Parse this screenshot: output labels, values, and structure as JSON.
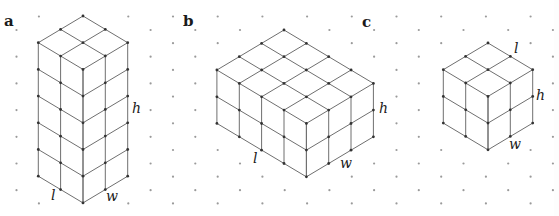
{
  "figure": {
    "grid": {
      "origin_x": 16.5,
      "col_spacing": 22.35,
      "cols": 25,
      "even_col_y0": 30,
      "odd_col_y0": 16.5,
      "row_spacing": 26.7,
      "rows": 8
    },
    "panels": [
      {
        "id": "a",
        "label": "a",
        "label_pos": [
          4,
          14
        ],
        "top_vertex": [
          83,
          16
        ],
        "left_units": 2,
        "right_units": 2,
        "height_units": 5,
        "dimension_labels": [
          {
            "text": "l",
            "pos": [
              51,
              188
            ]
          },
          {
            "text": "w",
            "pos": [
              106,
              189
            ]
          },
          {
            "text": "h",
            "pos": [
              132,
              101
            ]
          }
        ]
      },
      {
        "id": "b",
        "label": "b",
        "label_pos": [
          183,
          14
        ],
        "top_vertex": [
          284,
          30
        ],
        "left_units": 3,
        "right_units": 4,
        "height_units": 2,
        "dimension_labels": [
          {
            "text": "l",
            "pos": [
              253,
              151
            ]
          },
          {
            "text": "w",
            "pos": [
              340,
              156
            ]
          },
          {
            "text": "h",
            "pos": [
              379,
              101
            ]
          }
        ]
      },
      {
        "id": "c",
        "label": "c",
        "label_pos": [
          362,
          15
        ],
        "top_vertex": [
          488,
          43
        ],
        "left_units": 2,
        "right_units": 2,
        "height_units": 2,
        "dimension_labels": [
          {
            "text": "l",
            "pos": [
              514,
              41
            ]
          },
          {
            "text": "h",
            "pos": [
              536,
              88
            ]
          },
          {
            "text": "w",
            "pos": [
              509,
              137
            ]
          }
        ]
      }
    ],
    "colors": {
      "edge": "#6f6f6f",
      "vertex": "#333333",
      "grid_dot": "#9a9a9a",
      "text": "#1a1a1a",
      "background": "#ffffff"
    }
  }
}
